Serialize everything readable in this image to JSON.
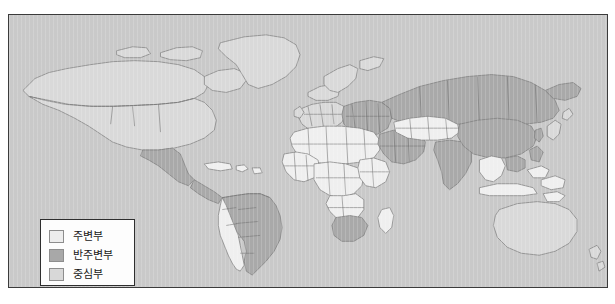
{
  "figure": {
    "kind": "world-map",
    "background_color": "#c9c9c9",
    "frame_color": "#3b3b3b"
  },
  "legend": {
    "box_background": "#fdfdfd",
    "box_border": "#2e2e2e",
    "items": [
      {
        "label": "주변부",
        "color": "#ededed",
        "class_key": "periphery"
      },
      {
        "label": "반주변부",
        "color": "#a8a8a8",
        "class_key": "semi-periphery"
      },
      {
        "label": "중심부",
        "color": "#d8d8d8",
        "class_key": "core"
      }
    ]
  },
  "map": {
    "ocean_color": "#c9c9c9",
    "border_color": "#8a8a8a",
    "country_outline_color": "#6f6f6f",
    "regions": [
      {
        "name": "greenland",
        "class_key": "core"
      },
      {
        "name": "canada",
        "class_key": "core"
      },
      {
        "name": "united-states",
        "class_key": "core"
      },
      {
        "name": "mexico",
        "class_key": "semi-periphery"
      },
      {
        "name": "central-america",
        "class_key": "semi-periphery"
      },
      {
        "name": "caribbean",
        "class_key": "periphery"
      },
      {
        "name": "colombia-venezuela",
        "class_key": "semi-periphery"
      },
      {
        "name": "peru-bolivia-chile",
        "class_key": "periphery"
      },
      {
        "name": "brazil",
        "class_key": "semi-periphery"
      },
      {
        "name": "argentina",
        "class_key": "semi-periphery"
      },
      {
        "name": "western-europe",
        "class_key": "core"
      },
      {
        "name": "scandinavia",
        "class_key": "core"
      },
      {
        "name": "eastern-europe",
        "class_key": "semi-periphery"
      },
      {
        "name": "russia",
        "class_key": "semi-periphery"
      },
      {
        "name": "north-africa",
        "class_key": "periphery"
      },
      {
        "name": "west-africa",
        "class_key": "periphery"
      },
      {
        "name": "central-africa",
        "class_key": "periphery"
      },
      {
        "name": "east-africa",
        "class_key": "periphery"
      },
      {
        "name": "south-africa",
        "class_key": "semi-periphery"
      },
      {
        "name": "middle-east",
        "class_key": "semi-periphery"
      },
      {
        "name": "central-asia",
        "class_key": "periphery"
      },
      {
        "name": "india",
        "class_key": "semi-periphery"
      },
      {
        "name": "china",
        "class_key": "semi-periphery"
      },
      {
        "name": "southeast-asia",
        "class_key": "periphery"
      },
      {
        "name": "indonesia",
        "class_key": "periphery"
      },
      {
        "name": "japan",
        "class_key": "core"
      },
      {
        "name": "australia",
        "class_key": "core"
      },
      {
        "name": "new-zealand",
        "class_key": "core"
      }
    ]
  }
}
